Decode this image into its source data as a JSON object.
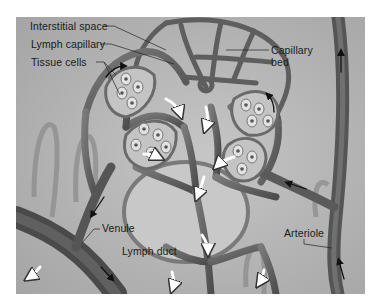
{
  "figure": {
    "type": "anatomical-illustration",
    "colors": {
      "background": "#ffffff",
      "tissue": "#b4b4b4",
      "vessel": "#6e6e6e",
      "vessel_dark": "#4a4a4a",
      "cell_cluster": "#c4c4c4",
      "cell": "#e2e2e2",
      "nucleus": "#555555",
      "arrow_white": "#ffffff",
      "arrow_black": "#111111",
      "label_text": "#1a1a1a"
    }
  },
  "labels": {
    "interstitial_space": "Interstitial space",
    "lymph_capillary": "Lymph capillary",
    "tissue_cells": "Tissue cells",
    "capillary_bed_line1": "Capillary",
    "capillary_bed_line2": "bed",
    "venule": "Venule",
    "lymph_duct": "Lymph duct",
    "arteriole": "Arteriole"
  },
  "flow_arrows": {
    "white_arrows_meaning": "lymph / interstitial fluid flow",
    "black_arrows_meaning": "blood flow"
  }
}
